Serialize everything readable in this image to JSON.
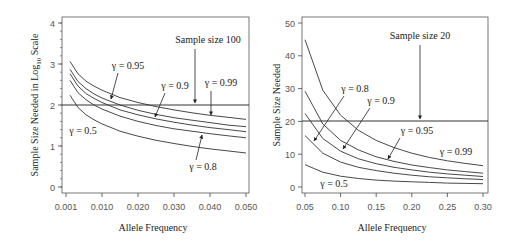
{
  "chart_data": [
    {
      "type": "line",
      "title": "",
      "xlabel": "Allele Frequency",
      "ylabel": "Sample Size Needed in Log10 Scale",
      "ylabel_main": "Sample Size Needed in Log",
      "ylabel_sub": "10",
      "ylabel_tail": " Scale",
      "x_ticks": [
        "0.001",
        "0.010",
        "0.020",
        "0.030",
        "0.040",
        "0.050"
      ],
      "y_ticks": [
        "0",
        "1",
        "2",
        "3",
        "4"
      ],
      "ylim": [
        0,
        4
      ],
      "grid": false,
      "x": [
        0.002,
        0.004,
        0.006,
        0.008,
        0.01,
        0.015,
        0.02,
        0.025,
        0.03,
        0.035,
        0.04,
        0.045,
        0.05
      ],
      "series": [
        {
          "name": "γ = 0.99",
          "values": [
            3.06,
            2.76,
            2.58,
            2.46,
            2.36,
            2.18,
            2.06,
            1.96,
            1.88,
            1.81,
            1.75,
            1.7,
            1.65
          ]
        },
        {
          "name": "γ = 0.95",
          "values": [
            2.87,
            2.57,
            2.4,
            2.27,
            2.17,
            2.0,
            1.87,
            1.77,
            1.69,
            1.63,
            1.57,
            1.51,
            1.47
          ]
        },
        {
          "name": "γ = 0.9",
          "values": [
            2.76,
            2.46,
            2.28,
            2.16,
            2.06,
            1.88,
            1.76,
            1.66,
            1.58,
            1.51,
            1.45,
            1.4,
            1.35
          ]
        },
        {
          "name": "γ = 0.8",
          "values": [
            2.6,
            2.3,
            2.13,
            2.0,
            1.9,
            1.73,
            1.6,
            1.5,
            1.42,
            1.36,
            1.3,
            1.25,
            1.2
          ]
        },
        {
          "name": "γ = 0.5",
          "values": [
            2.24,
            1.94,
            1.76,
            1.64,
            1.54,
            1.36,
            1.24,
            1.14,
            1.06,
            0.99,
            0.93,
            0.88,
            0.83
          ]
        }
      ],
      "reference_line": {
        "y": 2,
        "label": "Sample size 100"
      },
      "annotations": [
        "Sample size 100",
        "γ = 0.95",
        "γ = 0.9",
        "γ = 0.99",
        "γ = 0.5",
        "γ = 0.8"
      ]
    },
    {
      "type": "line",
      "title": "",
      "xlabel": "Allele Frequency",
      "ylabel": "Sample Size Needed",
      "x_ticks": [
        "0.05",
        "0.10",
        "0.15",
        "0.20",
        "0.25",
        "0.30"
      ],
      "y_ticks": [
        "0",
        "10",
        "20",
        "30",
        "40",
        "50"
      ],
      "xlim": [
        0.05,
        0.3
      ],
      "ylim": [
        0,
        50
      ],
      "grid": false,
      "x": [
        0.05,
        0.075,
        0.1,
        0.125,
        0.15,
        0.175,
        0.2,
        0.225,
        0.25,
        0.275,
        0.3
      ],
      "series": [
        {
          "name": "γ = 0.99",
          "values": [
            44.9,
            29.5,
            21.9,
            17.3,
            14.2,
            12.0,
            10.3,
            9.0,
            8.0,
            7.2,
            6.5
          ]
        },
        {
          "name": "γ = 0.95",
          "values": [
            29.2,
            19.2,
            14.2,
            11.3,
            9.2,
            7.8,
            6.7,
            5.9,
            5.2,
            4.7,
            4.2
          ]
        },
        {
          "name": "γ = 0.9",
          "values": [
            22.4,
            14.8,
            10.9,
            8.6,
            7.1,
            6.0,
            5.2,
            4.5,
            4.0,
            3.6,
            3.2
          ]
        },
        {
          "name": "γ = 0.8",
          "values": [
            15.7,
            10.3,
            7.6,
            6.0,
            5.0,
            4.2,
            3.6,
            3.1,
            2.8,
            2.5,
            2.3
          ]
        },
        {
          "name": "γ = 0.5",
          "values": [
            6.8,
            4.5,
            3.3,
            2.6,
            2.1,
            1.8,
            1.6,
            1.4,
            1.2,
            1.1,
            1.0
          ]
        }
      ],
      "reference_line": {
        "y": 20,
        "label": "Sample size 20"
      },
      "annotations": [
        "Sample size 20",
        "γ = 0.8",
        "γ = 0.9",
        "γ = 0.95",
        "γ = 0.99",
        "γ = 0.5"
      ]
    }
  ],
  "left": {
    "xlabel": "Allele Frequency",
    "ylabel_main": "Sample Size Needed in Log",
    "ylabel_sub": "10",
    "ylabel_tail": " Scale",
    "ref_label": "Sample size 100",
    "labels": {
      "g95": "γ = 0.95",
      "g9": "γ = 0.9",
      "g99": "γ = 0.99",
      "g5": "γ = 0.5",
      "g8": "γ = 0.8"
    }
  },
  "right": {
    "xlabel": "Allele Frequency",
    "ylabel": "Sample Size Needed",
    "ref_label": "Sample size 20",
    "labels": {
      "g8": "γ = 0.8",
      "g9": "γ = 0.9",
      "g95": "γ = 0.95",
      "g99": "γ = 0.99",
      "g5": "γ = 0.5"
    }
  }
}
